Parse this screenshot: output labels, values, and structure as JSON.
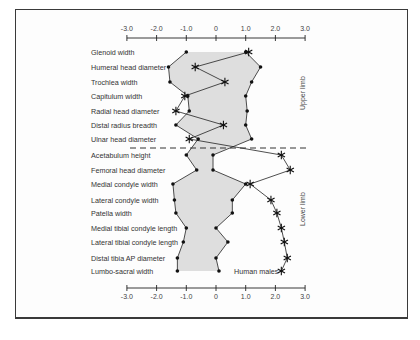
{
  "chart_data": {
    "type": "line",
    "title": "",
    "xlabel": "",
    "ylabel": "",
    "xlim": [
      -3.0,
      3.0
    ],
    "x_ticks": [
      "-3.0",
      "-2.0",
      "-1.0",
      "0",
      "1.0",
      "2.0",
      "3.0"
    ],
    "grid": false,
    "categories": [
      "Glenoid width",
      "Humeral head diameter",
      "Trochlea width",
      "Capitulum width",
      "Radial head diameter",
      "Distal radius breadth",
      "Ulnar head diameter",
      "Acetabulum height",
      "Femoral head diameter",
      "Medial condyle width",
      "Lateral condyle width",
      "Patella width",
      "Medial tibial condyle length",
      "Lateral tibial condyle length",
      "Distal tibia AP diameter",
      "Lumbo-sacral width"
    ],
    "groups": [
      {
        "label": "Upper limb",
        "from": 0,
        "to": 6
      },
      {
        "label": "Lower limb",
        "from": 7,
        "to": 15
      }
    ],
    "series": [
      {
        "name": "Range lower bound",
        "marker": "dot",
        "values": [
          -1.0,
          -1.6,
          -1.55,
          -0.95,
          -0.9,
          -1.35,
          -0.6,
          -1.0,
          -0.65,
          -1.45,
          -1.4,
          -1.35,
          -1.0,
          -1.1,
          -1.3,
          -1.3
        ]
      },
      {
        "name": "Range upper bound",
        "marker": "dot",
        "values": [
          1.0,
          1.5,
          1.2,
          1.0,
          1.05,
          1.0,
          1.2,
          -0.1,
          -0.1,
          1.0,
          0.55,
          0.55,
          0.0,
          0.4,
          0.0,
          0.1
        ]
      },
      {
        "name": "Human males",
        "marker": "asterisk",
        "values": [
          1.1,
          -0.7,
          0.3,
          -1.05,
          -1.35,
          0.25,
          -0.9,
          2.2,
          2.5,
          1.15,
          1.85,
          2.05,
          2.2,
          2.3,
          2.4,
          2.2
        ]
      }
    ],
    "annotations": [
      "Human males",
      "Upper limb",
      "Lower limb"
    ],
    "divider": "dashed line between Ulnar head diameter and Acetabulum height"
  },
  "labels": {
    "series_label": "Human males",
    "upper_group": "Upper limb",
    "lower_group": "Lower limb"
  }
}
